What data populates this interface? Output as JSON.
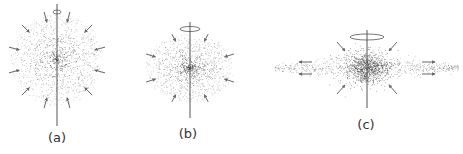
{
  "figure": {
    "colors": {
      "dots": "#333333",
      "axis": "#555555",
      "arrows": "#555555",
      "background": "#ffffff"
    },
    "panels": [
      {
        "id": "a",
        "label": "(a)",
        "shape": "sphere",
        "center": [
          57,
          60
        ],
        "rx": 46,
        "ry": 46,
        "axis": {
          "x": 57,
          "y1": 4,
          "y2": 126
        },
        "rotation_ring": {
          "cx": 57,
          "cy": 12,
          "rx": 4,
          "ry": 2
        },
        "arrows": "inward-radial",
        "arrow_count": 12,
        "label_pos": [
          57,
          143
        ]
      },
      {
        "id": "b",
        "label": "(b)",
        "shape": "oblate",
        "center": [
          190,
          68
        ],
        "rx": 44,
        "ry": 34,
        "axis": {
          "x": 190,
          "y1": 22,
          "y2": 118
        },
        "rotation_ring": {
          "cx": 190,
          "cy": 29,
          "rx": 10,
          "ry": 2.5
        },
        "arrows": "inward-radial",
        "arrow_count": 8,
        "label_pos": [
          188,
          139
        ]
      },
      {
        "id": "c",
        "label": "(c)",
        "shape": "disk",
        "center": [
          367,
          68
        ],
        "rx": 20,
        "ry": 18,
        "disk_halfwidth": 92,
        "disk_halfheight": 5,
        "axis": {
          "x": 367,
          "y1": 30,
          "y2": 108
        },
        "rotation_ring": {
          "cx": 367,
          "cy": 37,
          "rx": 17,
          "ry": 3
        },
        "arrows": "inward-diagonal + outward-horizontal",
        "label_pos": [
          366,
          130
        ]
      }
    ]
  }
}
